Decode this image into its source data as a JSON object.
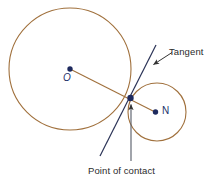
{
  "figure": {
    "background_color": "#ffffff",
    "circle_stroke_color": "#a0703c",
    "tangent_line_color": "#2b3357",
    "point_color": "#1e2a5e",
    "annotation_color": "#2b2b2b",
    "leader_color": "#333333"
  },
  "labels": {
    "tangent": "Tangent",
    "point_of_contact": "Point of contact",
    "center_large": "O",
    "center_small": "N"
  },
  "geometry": {
    "large_circle": {
      "cx": 70,
      "cy": 69,
      "r": 61
    },
    "small_circle": {
      "cx": 157,
      "cy": 112,
      "r": 29
    },
    "point_of_contact": {
      "x": 130.5,
      "y": 98
    },
    "center_large_point": {
      "x": 70,
      "y": 69
    },
    "center_small_point": {
      "x": 155,
      "y": 112
    },
    "tangent_line": {
      "x1": 156,
      "y1": 45,
      "x2": 100,
      "y2": 156
    },
    "radius_line": {
      "x1": 70,
      "y1": 69,
      "x2": 155,
      "y2": 112
    },
    "tangent_leader": {
      "x1": 172,
      "y1": 53,
      "x2": 151,
      "y2": 66
    },
    "contact_leader": {
      "x1": 131,
      "y1": 161,
      "x2": 131,
      "y2": 103
    }
  }
}
